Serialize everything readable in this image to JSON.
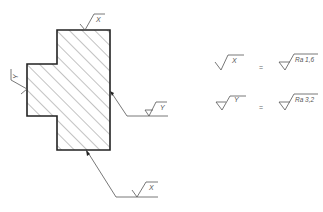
{
  "drawing": {
    "type": "surface-roughness-annotation",
    "part": {
      "hatch": "diagonal 45deg",
      "outline_color": "#222222",
      "hatch_color": "#666666"
    },
    "symbols_on_part": {
      "top": {
        "label": "X",
        "kind": "machined"
      },
      "left": {
        "label": "Y",
        "kind": "machined"
      },
      "right_leader": {
        "label": "Y",
        "kind": "machined-triangle"
      },
      "bottom_leader": {
        "label": "X",
        "kind": "machined"
      }
    }
  },
  "legend": {
    "rows": [
      {
        "symbol_label": "X",
        "equals": "=",
        "value": "Ra 1,6"
      },
      {
        "symbol_label": "Y",
        "equals": "=",
        "value": "Ra 3,2"
      }
    ]
  },
  "caption": {
    "text": ""
  },
  "colors": {
    "line": "#222222",
    "text": "#555555",
    "background": "#ffffff"
  }
}
